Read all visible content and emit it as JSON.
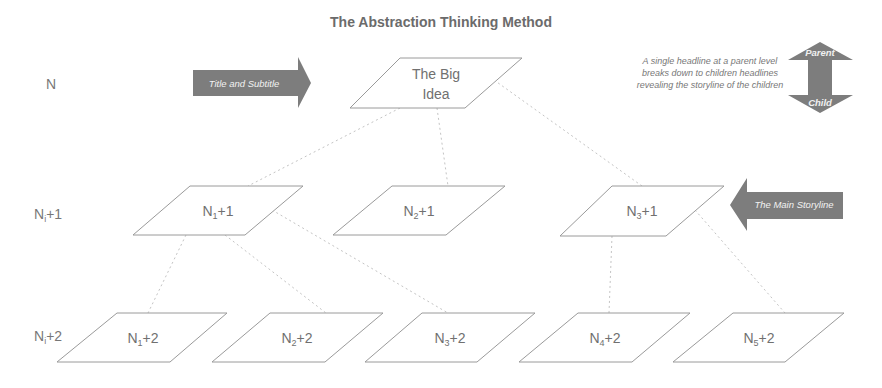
{
  "title": "The Abstraction Thinking Method",
  "levels": [
    {
      "base": "N",
      "sub": "",
      "suffix": ""
    },
    {
      "base": "N",
      "sub": "i",
      "suffix": "+1"
    },
    {
      "base": "N",
      "sub": "i",
      "suffix": "+2"
    }
  ],
  "annotations": {
    "title_arrow": "Title and Subtitle",
    "storyline_arrow": "The Main Storyline",
    "note_lines": [
      "A single headline at a parent level",
      "breaks down to children headlines",
      "revealing the storyline of the children"
    ],
    "parent_label": "Parent",
    "child_label": "Child"
  },
  "nodes": {
    "root": {
      "line1": "The Big",
      "line2": "Idea"
    },
    "level1": [
      {
        "base": "N",
        "sub": "1",
        "suffix": "+1"
      },
      {
        "base": "N",
        "sub": "2",
        "suffix": "+1"
      },
      {
        "base": "N",
        "sub": "3",
        "suffix": "+1"
      }
    ],
    "level2": [
      {
        "base": "N",
        "sub": "1",
        "suffix": "+2"
      },
      {
        "base": "N",
        "sub": "2",
        "suffix": "+2"
      },
      {
        "base": "N",
        "sub": "3",
        "suffix": "+2"
      },
      {
        "base": "N",
        "sub": "4",
        "suffix": "+2"
      },
      {
        "base": "N",
        "sub": "5",
        "suffix": "+2"
      }
    ]
  },
  "colors": {
    "arrow_fill": "#7d7d7d",
    "shape_stroke": "#9a9a9a",
    "link_stroke": "#c4c4c4",
    "text": "#707070"
  }
}
